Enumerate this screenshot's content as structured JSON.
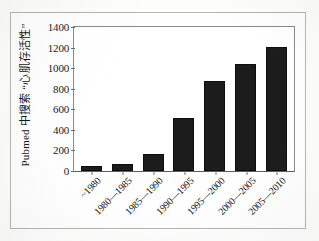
{
  "chart_data": {
    "type": "bar",
    "title": "",
    "subtitle": "",
    "xlabel": "",
    "ylabel": "Pubmed 中搜索 “心肌存活性”",
    "categories": [
      "~1980",
      "1980—1985",
      "1985—1990",
      "1990—1995",
      "1995—2000",
      "2000—2005",
      "2005—2010"
    ],
    "values": [
      50,
      70,
      165,
      515,
      880,
      1045,
      1210
    ],
    "series": [
      {
        "name": "Pubmed 检索命中数",
        "values": [
          50,
          70,
          165,
          515,
          880,
          1045,
          1210
        ]
      }
    ],
    "ylim": [
      0,
      1400
    ],
    "yticks": [
      0,
      200,
      400,
      600,
      800,
      1000,
      1200,
      1400
    ],
    "ytick_labels": [
      "0",
      "200",
      "400",
      "600",
      "800",
      "1000",
      "1200",
      "1400"
    ],
    "grid": false,
    "legend": false,
    "legend_position": "none",
    "bar_color": "#1c1c1c",
    "axis_color": "#6e6e6e",
    "frame_color": "#b4b4b4",
    "background_color": "#fdfdfc",
    "annotations": []
  },
  "figure": {
    "caption": ""
  }
}
